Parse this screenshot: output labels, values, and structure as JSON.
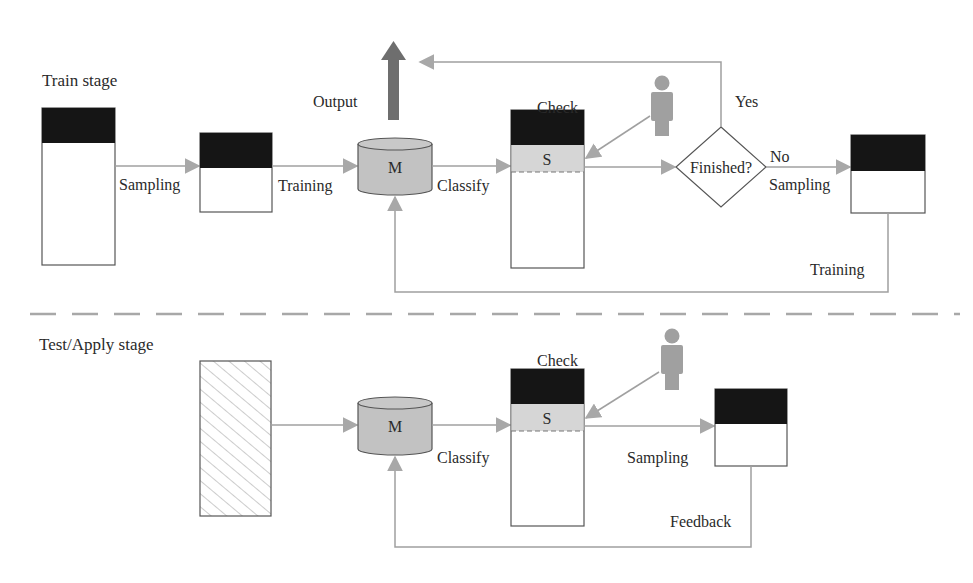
{
  "colors": {
    "line": "#a0a0a0",
    "arrow": "#a8a8a8",
    "box_border": "#555555",
    "black_fill": "#151515",
    "cylinder_fill": "#c2c2c2",
    "s_fill": "#d6d6d6",
    "person": "#a0a0a0",
    "output_arrow": "#6e6e6e",
    "separator": "#a8a8a8"
  },
  "train": {
    "title": "Train stage",
    "sampling_label": "Sampling",
    "training_label": "Training",
    "model_label": "M",
    "output_label": "Output",
    "classify_label": "Classify",
    "selected_label": "S",
    "check_label": "Check",
    "decision_label": "Finished?",
    "yes_label": "Yes",
    "no_label": "No",
    "resample_label": "Sampling",
    "retrain_label": "Training"
  },
  "test": {
    "title": "Test/Apply stage",
    "model_label": "M",
    "classify_label": "Classify",
    "selected_label": "S",
    "check_label": "Check",
    "sampling_label": "Sampling",
    "feedback_label": "Feedback"
  }
}
